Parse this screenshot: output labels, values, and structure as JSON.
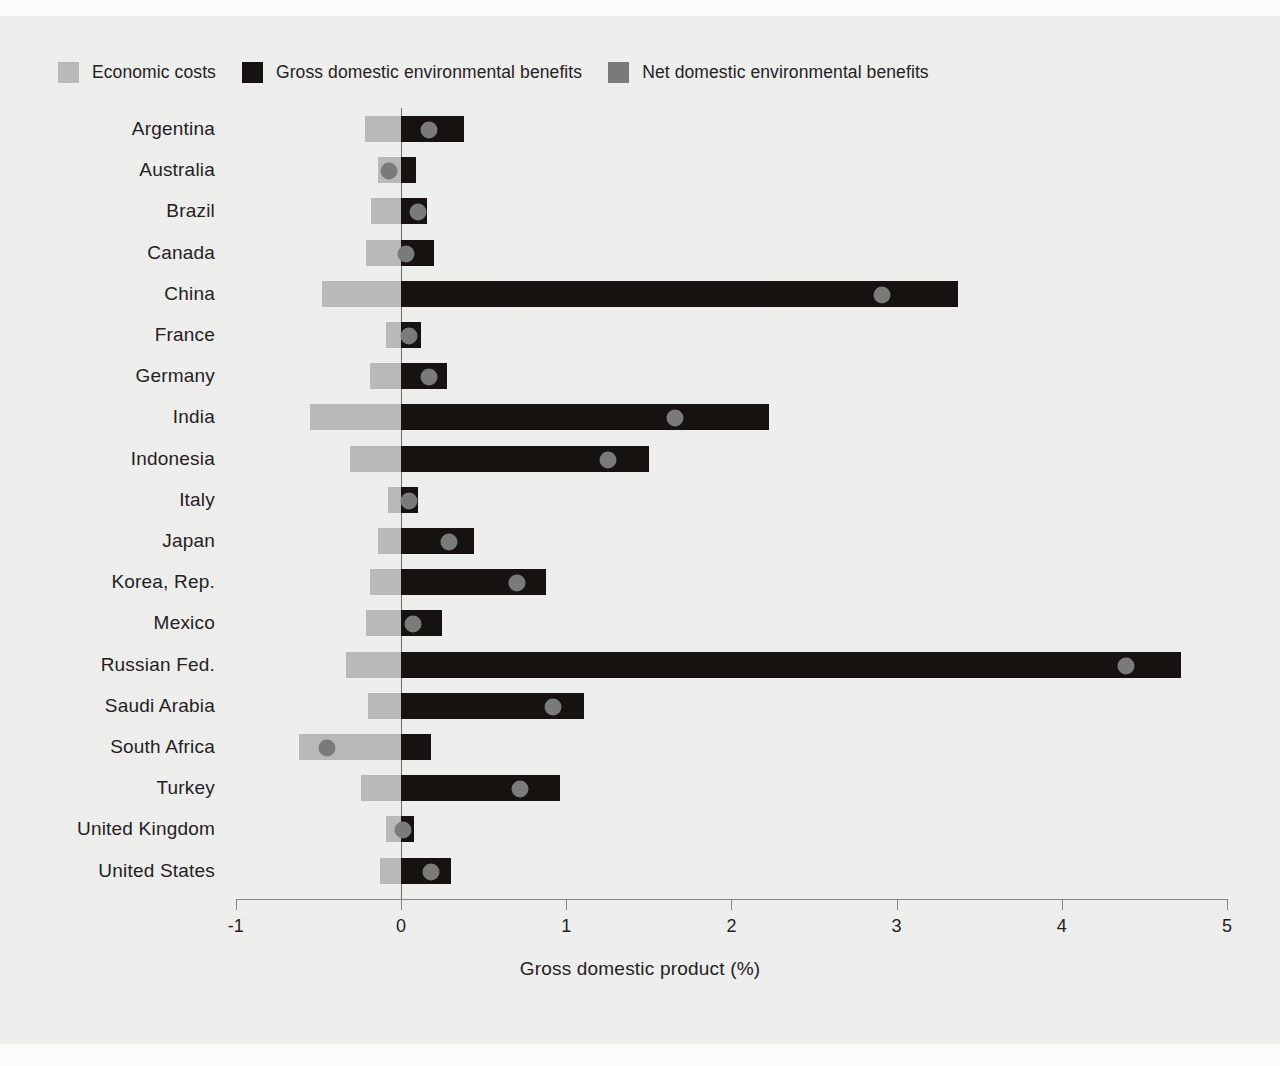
{
  "legend": {
    "items": [
      {
        "label": "Economic costs",
        "color": "#b9b9b7",
        "key": "economic-costs"
      },
      {
        "label": "Gross domestic environmental benefits",
        "color": "#14110f",
        "key": "gross-domestic-environmental-benefits"
      },
      {
        "label": "Net domestic environmental benefits",
        "color": "#7a7a78",
        "key": "net-domestic-environmental-benefits"
      }
    ]
  },
  "chart_data": {
    "type": "bar",
    "orientation": "horizontal",
    "title": "",
    "xlabel": "Gross domestic product (%)",
    "ylabel": "",
    "xlim": [
      -1,
      5
    ],
    "xticks": [
      -1,
      0,
      1,
      2,
      3,
      4,
      5
    ],
    "xtick_labels": [
      "-1",
      "0",
      "1",
      "2",
      "3",
      "4",
      "5"
    ],
    "grid": false,
    "legend_position": "top-left",
    "zero_reference_line": 0,
    "categories": [
      "Argentina",
      "Australia",
      "Brazil",
      "Canada",
      "China",
      "France",
      "Germany",
      "India",
      "Indonesia",
      "Italy",
      "Japan",
      "Korea, Rep.",
      "Mexico",
      "Russian Fed.",
      "Saudi Arabia",
      "South Africa",
      "Turkey",
      "United Kingdom",
      "United States"
    ],
    "series": [
      {
        "name": "Economic costs",
        "color": "#b9b9b7",
        "values": [
          -0.22,
          -0.14,
          -0.18,
          -0.21,
          -0.48,
          -0.09,
          -0.19,
          -0.55,
          -0.31,
          -0.08,
          -0.14,
          -0.19,
          -0.21,
          -0.33,
          -0.2,
          -0.62,
          -0.24,
          -0.09,
          -0.13
        ]
      },
      {
        "name": "Gross domestic environmental benefits",
        "color": "#14110f",
        "values": [
          0.38,
          0.09,
          0.16,
          0.2,
          3.37,
          0.12,
          0.28,
          2.23,
          1.5,
          0.1,
          0.44,
          0.88,
          0.25,
          4.72,
          1.11,
          0.18,
          0.96,
          0.08,
          0.3
        ]
      },
      {
        "name": "Net domestic environmental benefits",
        "color": "#7a7a78",
        "type": "point",
        "values": [
          0.17,
          -0.07,
          0.1,
          0.03,
          2.91,
          0.05,
          0.17,
          1.66,
          1.25,
          0.05,
          0.29,
          0.7,
          0.07,
          4.39,
          0.92,
          -0.45,
          0.72,
          0.01,
          0.18
        ]
      }
    ]
  }
}
